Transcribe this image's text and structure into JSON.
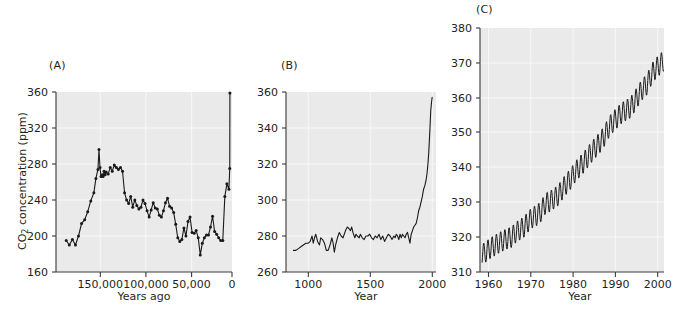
{
  "figure": {
    "background": "#ffffff",
    "plot_background": "#eaeaea",
    "line_color": "#1a1a1a",
    "axis_color": "#3a3a3a",
    "gridline_color": "#f7f7f7"
  },
  "panels": {
    "a": {
      "label": "(A)",
      "ylabel_main": "CO",
      "ylabel_sub": "2",
      "ylabel_tail": " concentration (ppm)",
      "xlabel": "Years ago",
      "yticks": [
        "160",
        "200",
        "240",
        "280",
        "320",
        "360"
      ],
      "xticks": [
        "150,000",
        "100,000",
        "50,000",
        "0"
      ]
    },
    "b": {
      "label": "(B)",
      "xlabel": "Year",
      "yticks": [
        "260",
        "280",
        "300",
        "320",
        "340",
        "360"
      ],
      "xticks": [
        "1000",
        "1500",
        "2000"
      ]
    },
    "c": {
      "label": "(C)",
      "xlabel": "Year",
      "yticks": [
        "310",
        "320",
        "330",
        "340",
        "350",
        "360",
        "370",
        "380"
      ],
      "xticks": [
        "1960",
        "1970",
        "1980",
        "1990",
        "2000"
      ]
    }
  },
  "chart_data": [
    {
      "id": "panel-a",
      "type": "line",
      "title": "(A)",
      "xlabel": "Years ago",
      "ylabel": "CO2 concentration (ppm)",
      "xlim": [
        170000,
        -2000
      ],
      "ylim": [
        160,
        360
      ],
      "x_reversed": true,
      "grid": true,
      "markers": true,
      "legend": null,
      "xtick_values": [
        150000,
        100000,
        50000,
        0
      ],
      "ytick_values": [
        160,
        200,
        240,
        280,
        320,
        360
      ],
      "x": [
        160000,
        157000,
        154000,
        151000,
        148000,
        145000,
        142000,
        139000,
        136000,
        133000,
        131000,
        129000,
        128000,
        127000,
        126000,
        125000,
        124000,
        123000,
        122000,
        121000,
        119000,
        117000,
        115000,
        113000,
        111000,
        109000,
        107000,
        105000,
        103000,
        101000,
        99000,
        97000,
        95000,
        93000,
        91000,
        89000,
        87000,
        85000,
        83000,
        81000,
        79000,
        77000,
        75000,
        73000,
        71000,
        69000,
        67000,
        65000,
        63000,
        61000,
        59000,
        57000,
        55000,
        53000,
        51000,
        49000,
        47000,
        45000,
        43000,
        41000,
        39000,
        37000,
        35000,
        33000,
        31000,
        29000,
        27000,
        25000,
        23000,
        21000,
        19000,
        17000,
        15000,
        13000,
        11000,
        9000,
        7000,
        5000,
        3000,
        1000,
        200,
        50
      ],
      "y": [
        195,
        190,
        196,
        190,
        200,
        214,
        218,
        227,
        239,
        248,
        264,
        274,
        296,
        276,
        266,
        268,
        266,
        272,
        268,
        271,
        269,
        276,
        272,
        279,
        276,
        274,
        276,
        272,
        248,
        240,
        236,
        244,
        232,
        240,
        234,
        230,
        232,
        240,
        236,
        228,
        221,
        229,
        237,
        231,
        230,
        223,
        221,
        228,
        237,
        242,
        233,
        231,
        226,
        213,
        198,
        194,
        196,
        209,
        200,
        216,
        221,
        204,
        203,
        206,
        198,
        179,
        192,
        198,
        201,
        201,
        210,
        222,
        205,
        202,
        198,
        195,
        195,
        244,
        258,
        252,
        275,
        359
      ],
      "description": "Ice-core CO2 record over last 160,000 years; glacial lows near 190 ppm, interglacial highs near 280 ppm, modern spike to ~360 ppm."
    },
    {
      "id": "panel-b",
      "type": "line",
      "title": "(B)",
      "xlabel": "Year",
      "ylabel": "CO2 concentration (ppm)",
      "xlim": [
        820,
        2030
      ],
      "ylim": [
        260,
        360
      ],
      "grid": true,
      "markers": false,
      "legend": null,
      "xtick_values": [
        1000,
        1500,
        2000
      ],
      "ytick_values": [
        260,
        280,
        300,
        320,
        340,
        360
      ],
      "x": [
        880,
        900,
        920,
        940,
        960,
        980,
        1000,
        1015,
        1030,
        1040,
        1050,
        1060,
        1075,
        1090,
        1100,
        1115,
        1130,
        1145,
        1160,
        1175,
        1190,
        1200,
        1210,
        1220,
        1235,
        1250,
        1265,
        1280,
        1290,
        1300,
        1315,
        1330,
        1340,
        1350,
        1360,
        1375,
        1385,
        1395,
        1410,
        1420,
        1435,
        1450,
        1465,
        1480,
        1495,
        1510,
        1525,
        1540,
        1555,
        1570,
        1585,
        1600,
        1615,
        1630,
        1645,
        1660,
        1675,
        1690,
        1700,
        1710,
        1720,
        1730,
        1740,
        1750,
        1760,
        1770,
        1780,
        1790,
        1800,
        1810,
        1820,
        1830,
        1840,
        1850,
        1860,
        1870,
        1880,
        1890,
        1900,
        1910,
        1920,
        1930,
        1940,
        1950,
        1958,
        1965,
        1972,
        1980,
        1988,
        1995,
        1999
      ],
      "y": [
        272,
        272,
        273,
        274,
        275,
        276,
        276,
        277,
        280,
        276,
        279,
        281,
        277,
        275,
        279,
        278,
        276,
        272,
        272,
        275,
        279,
        276,
        271,
        275,
        279,
        282,
        280,
        279,
        281,
        283,
        285,
        284,
        283,
        285,
        282,
        279,
        281,
        280,
        279,
        281,
        279,
        278,
        280,
        280,
        281,
        279,
        278,
        280,
        279,
        281,
        278,
        280,
        277,
        279,
        281,
        280,
        278,
        280,
        279,
        281,
        280,
        278,
        281,
        279,
        281,
        280,
        279,
        281,
        282,
        279,
        276,
        281,
        283,
        285,
        286,
        287,
        290,
        294,
        296,
        299,
        302,
        306,
        308,
        311,
        315,
        320,
        327,
        338,
        350,
        355,
        357
      ],
      "description": "CO2 from ice cores over last 1,100 years; stable near 280 ppm until ~1800, then steep industrial rise to ~357 ppm."
    },
    {
      "id": "panel-c",
      "type": "line",
      "title": "(C)",
      "xlabel": "Year",
      "ylabel": "CO2 concentration (ppm)",
      "xlim": [
        1957.5,
        2001
      ],
      "ylim": [
        310,
        380
      ],
      "grid": true,
      "markers": false,
      "legend": null,
      "xtick_values": [
        1960,
        1970,
        1980,
        1990,
        2000
      ],
      "ytick_values": [
        310,
        320,
        330,
        340,
        350,
        360,
        370,
        380
      ],
      "seasonal_amplitude_ppm": 6,
      "annual_means": {
        "years": [
          1958,
          1959,
          1960,
          1961,
          1962,
          1963,
          1964,
          1965,
          1966,
          1967,
          1968,
          1969,
          1970,
          1971,
          1972,
          1973,
          1974,
          1975,
          1976,
          1977,
          1978,
          1979,
          1980,
          1981,
          1982,
          1983,
          1984,
          1985,
          1986,
          1987,
          1988,
          1989,
          1990,
          1991,
          1992,
          1993,
          1994,
          1995,
          1996,
          1997,
          1998,
          1999,
          2000
        ],
        "values": [
          315.0,
          315.9,
          316.9,
          317.6,
          318.4,
          319.0,
          319.6,
          320.0,
          321.4,
          322.2,
          323.0,
          324.6,
          325.7,
          326.3,
          327.5,
          329.7,
          330.2,
          331.1,
          332.0,
          333.8,
          335.4,
          336.8,
          338.7,
          340.1,
          341.4,
          343.0,
          344.6,
          346.0,
          347.4,
          349.2,
          351.6,
          353.1,
          354.4,
          355.6,
          356.4,
          357.1,
          358.8,
          360.8,
          362.6,
          363.8,
          366.6,
          368.3,
          369.5
        ]
      },
      "description": "Mauna Loa Keeling curve 1958-2000 with strong annual sawtooth seasonal cycle superimposed on rising trend."
    }
  ]
}
